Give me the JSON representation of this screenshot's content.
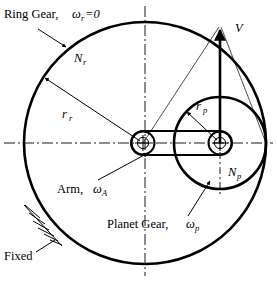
{
  "figure": {
    "title_visible": false,
    "type": "planetary-gear-kinematics-diagram",
    "background_color": "#ffffff",
    "line_color": "#000000"
  },
  "labels": {
    "ring_gear": {
      "text_main": "Ring Gear,",
      "symbol": "ω",
      "subscript": "r",
      "equals_value": "=0"
    },
    "ring_teeth": {
      "symbol": "N",
      "subscript": "r"
    },
    "ring_radius": {
      "symbol": "r",
      "subscript": "r"
    },
    "planet_radius": {
      "symbol": "r",
      "subscript": "p"
    },
    "planet_teeth": {
      "symbol": "N",
      "subscript": "p"
    },
    "velocity": {
      "symbol": "V"
    },
    "arm": {
      "text_main": "Arm,",
      "symbol": "ω",
      "subscript": "A"
    },
    "planet_gear": {
      "text_main": "Planet Gear,",
      "symbol": "ω",
      "subscript": "p"
    },
    "fixed": {
      "text": "Fixed"
    }
  },
  "geometry": {
    "ring_center": {
      "x": 145,
      "y": 143
    },
    "ring_radius": 121,
    "planet_center": {
      "x": 220,
      "y": 143
    },
    "planet_radius": 46,
    "arm_pivot": {
      "x": 143,
      "y": 143
    },
    "velocity_arrow": {
      "x": 220,
      "y_tail": 143,
      "y_tip": 26
    }
  },
  "annotations": {
    "icons": [
      "ring-gear-leader-arrow",
      "ring-radius-arrow",
      "planet-radius-arrow",
      "arm-leader-arrow",
      "planet-gear-leader-arrow",
      "velocity-vector-arrow",
      "fixed-ground-hatching",
      "horizontal-centerline",
      "vertical-centerline"
    ]
  }
}
